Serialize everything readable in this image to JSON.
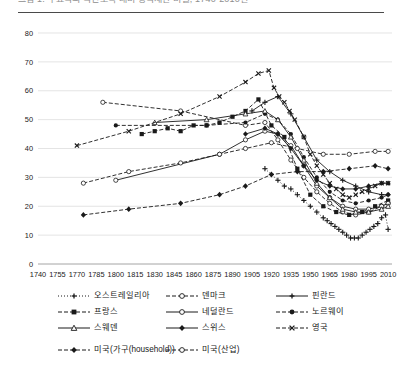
{
  "caption": {
    "text": "그림 1. 주요국의 국민소득 대비 상속재산 비율, 1740-2010년"
  },
  "chart_data": {
    "type": "line",
    "title": "",
    "xlabel": "",
    "ylabel": "",
    "xlim": [
      1740,
      2013
    ],
    "ylim": [
      0,
      80
    ],
    "yticks": [
      0,
      10,
      20,
      30,
      40,
      50,
      60,
      70,
      80
    ],
    "xticks": [
      1740,
      1755,
      1770,
      1785,
      1800,
      1815,
      1830,
      1845,
      1860,
      1875,
      1890,
      1905,
      1920,
      1935,
      1950,
      1965,
      1980,
      1995,
      2010
    ],
    "grid": true,
    "legend_position": "bottom",
    "series": [
      {
        "name": "오스트레일리아",
        "marker": "plus",
        "dash": "1,2",
        "x": [
          1915,
          1920,
          1925,
          1930,
          1935,
          1940,
          1945,
          1950,
          1955,
          1960,
          1963,
          1966,
          1969,
          1972,
          1975,
          1978,
          1981,
          1984,
          1987,
          1990,
          1993,
          1996,
          1999,
          2002,
          2005,
          2008,
          2010
        ],
        "y": [
          33,
          31,
          29,
          27,
          26,
          24,
          22,
          20,
          18,
          16,
          15,
          14,
          13,
          12,
          11,
          10,
          9,
          9,
          9,
          10,
          11,
          12,
          13,
          14,
          16,
          17,
          12
        ]
      },
      {
        "name": "덴마크",
        "marker": "circle-open",
        "dash": "4,2",
        "x": [
          1790,
          1850,
          1900,
          1915,
          1925,
          1935,
          1945,
          1955,
          1965,
          1975,
          1985,
          1995,
          2005,
          2010
        ],
        "y": [
          56,
          53,
          48,
          49,
          43,
          36,
          30,
          25,
          21,
          18,
          17,
          18,
          20,
          21
        ]
      },
      {
        "name": "핀란드",
        "marker": "plus-solid",
        "dash": "none",
        "x": [
          1905,
          1915,
          1925,
          1935,
          1945,
          1955,
          1965,
          1975,
          1985,
          1995,
          2005,
          2010
        ],
        "y": [
          53,
          56,
          58,
          52,
          44,
          36,
          32,
          29,
          27,
          25,
          24,
          24
        ]
      },
      {
        "name": "프랑스",
        "marker": "square",
        "dash": "4,2",
        "x": [
          1820,
          1830,
          1840,
          1850,
          1860,
          1870,
          1880,
          1890,
          1900,
          1910,
          1920,
          1930,
          1940,
          1950,
          1960,
          1970,
          1980,
          1990,
          2000,
          2010
        ],
        "y": [
          45,
          46,
          47,
          46,
          48,
          48,
          49,
          51,
          53,
          57,
          48,
          44,
          33,
          24,
          20,
          18,
          17,
          18,
          20,
          22
        ]
      },
      {
        "name": "네덜란드",
        "marker": "circle-open",
        "dash": "none",
        "x": [
          1800,
          1880,
          1900,
          1915,
          1925,
          1935,
          1945,
          1955,
          1965,
          1975,
          1985,
          1995,
          2005,
          2010
        ],
        "y": [
          29,
          38,
          43,
          46,
          45,
          41,
          34,
          27,
          23,
          20,
          19,
          19,
          20,
          21
        ]
      },
      {
        "name": "노르웨이",
        "marker": "circle",
        "dash": "4,2",
        "x": [
          1800,
          1870,
          1900,
          1915,
          1925,
          1935,
          1945,
          1955,
          1965,
          1975,
          1985,
          1995,
          2005,
          2010
        ],
        "y": [
          48,
          48,
          49,
          52,
          50,
          45,
          37,
          30,
          25,
          22,
          21,
          22,
          23,
          24
        ]
      },
      {
        "name": "스웨덴",
        "marker": "triangle",
        "dash": "none",
        "x": [
          1830,
          1870,
          1900,
          1915,
          1925,
          1935,
          1945,
          1955,
          1965,
          1975,
          1985,
          1995,
          2005,
          2010
        ],
        "y": [
          49,
          50,
          52,
          53,
          50,
          44,
          36,
          28,
          23,
          19,
          18,
          18,
          19,
          20
        ]
      },
      {
        "name": "스위스",
        "marker": "diamond",
        "dash": "none",
        "x": [
          1900,
          1915,
          1925,
          1935,
          1945,
          1955,
          1965,
          1975,
          1985,
          1995,
          2005,
          2010
        ],
        "y": [
          45,
          47,
          45,
          40,
          34,
          29,
          27,
          26,
          26,
          27,
          28,
          28
        ]
      },
      {
        "name": "영국",
        "marker": "cross",
        "dash": "4,2",
        "x": [
          1770,
          1810,
          1850,
          1880,
          1900,
          1910,
          1918,
          1922,
          1926,
          1930,
          1934,
          1938,
          1945,
          1950,
          1955,
          1960,
          1965,
          1970,
          1975,
          1980,
          1985,
          1990,
          1995,
          2000,
          2005,
          2010
        ],
        "y": [
          41,
          46,
          52,
          58,
          63,
          66,
          67,
          61,
          58,
          56,
          53,
          50,
          44,
          38,
          34,
          31,
          28,
          26,
          24,
          23,
          24,
          25,
          26,
          27,
          28,
          28
        ]
      },
      {
        "name": "미국(가구(household))",
        "marker": "diamond-solid",
        "dash": "4,2",
        "x": [
          1775,
          1810,
          1850,
          1880,
          1900,
          1920,
          1940,
          1960,
          1980,
          2000,
          2010
        ],
        "y": [
          17,
          19,
          21,
          24,
          27,
          31,
          32,
          32,
          33,
          34,
          33
        ]
      },
      {
        "name": "미국(산업)",
        "marker": "circle-open",
        "dash": "4,2",
        "x": [
          1775,
          1810,
          1850,
          1880,
          1900,
          1920,
          1940,
          1960,
          1980,
          2000,
          2010
        ],
        "y": [
          28,
          32,
          35,
          38,
          40,
          42,
          40,
          38,
          38,
          39,
          39
        ]
      }
    ]
  },
  "legend": {
    "rows": [
      [
        {
          "label": "오스트레일리아",
          "marker": "plus",
          "dash": "1,2"
        },
        {
          "label": "덴마크",
          "marker": "circle-open",
          "dash": "4,2"
        },
        {
          "label": "핀란드",
          "marker": "plus-solid",
          "dash": "none"
        }
      ],
      [
        {
          "label": "프랑스",
          "marker": "square",
          "dash": "4,2"
        },
        {
          "label": "네덜란드",
          "marker": "circle-open",
          "dash": "none"
        },
        {
          "label": "노르웨이",
          "marker": "circle",
          "dash": "4,2"
        }
      ],
      [
        {
          "label": "스웨덴",
          "marker": "triangle",
          "dash": "none"
        },
        {
          "label": "스위스",
          "marker": "diamond",
          "dash": "none"
        },
        {
          "label": "영국",
          "marker": "cross",
          "dash": "4,2"
        }
      ],
      [
        {
          "label": "미국(가구(household))",
          "marker": "diamond-solid",
          "dash": "4,2"
        },
        {
          "label": "미국(산업)",
          "marker": "circle-open",
          "dash": "4,2"
        }
      ]
    ]
  },
  "colors": {
    "ink": "#1a1a1a",
    "grid": "#d9d9d9",
    "rule": "#4a4a4a"
  }
}
